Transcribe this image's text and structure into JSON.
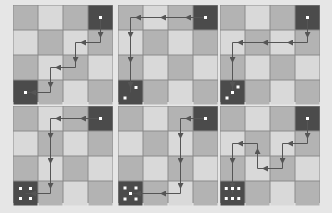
{
  "figure": {
    "grid": {
      "rows": 4,
      "cols": 4
    },
    "colors": {
      "background": "#e6e6e6",
      "cell_medium": "#b3b3b3",
      "cell_light": "#d9d9d9",
      "cell_dark": "#4b4b4b",
      "grid_line": "#8a8a8a",
      "arrow": "#555555",
      "pip": "#ffffff"
    },
    "panels": [
      {
        "id": 1,
        "start": [
          0,
          3
        ],
        "end": [
          3,
          0
        ],
        "end_pips": 1,
        "path": [
          [
            0,
            3
          ],
          [
            1,
            3
          ],
          [
            1,
            2
          ],
          [
            2,
            2
          ],
          [
            2,
            1
          ],
          [
            3,
            1
          ],
          [
            3,
            0
          ]
        ]
      },
      {
        "id": 2,
        "start": [
          0,
          3
        ],
        "end": [
          3,
          0
        ],
        "end_pips": 2,
        "path": [
          [
            0,
            3
          ],
          [
            0,
            0
          ],
          [
            3,
            0
          ]
        ]
      },
      {
        "id": 3,
        "start": [
          0,
          3
        ],
        "end": [
          3,
          0
        ],
        "end_pips": 3,
        "path": [
          [
            0,
            3
          ],
          [
            1,
            3
          ],
          [
            1,
            0
          ],
          [
            3,
            0
          ]
        ]
      },
      {
        "id": 4,
        "start": [
          0,
          3
        ],
        "end": [
          3,
          0
        ],
        "end_pips": 4,
        "path": [
          [
            0,
            3
          ],
          [
            0,
            1
          ],
          [
            3,
            1
          ],
          [
            3,
            0
          ]
        ]
      },
      {
        "id": 5,
        "start": [
          0,
          3
        ],
        "end": [
          3,
          0
        ],
        "end_pips": 5,
        "path": [
          [
            0,
            3
          ],
          [
            0,
            2
          ],
          [
            3,
            2
          ],
          [
            3,
            0
          ]
        ]
      },
      {
        "id": 6,
        "start": [
          0,
          3
        ],
        "end": [
          3,
          0
        ],
        "end_pips": 6,
        "path": [
          [
            0,
            3
          ],
          [
            1,
            3
          ],
          [
            1,
            2
          ],
          [
            2,
            2
          ],
          [
            2,
            1
          ],
          [
            1,
            1
          ],
          [
            1,
            0
          ],
          [
            3,
            0
          ]
        ]
      }
    ]
  }
}
